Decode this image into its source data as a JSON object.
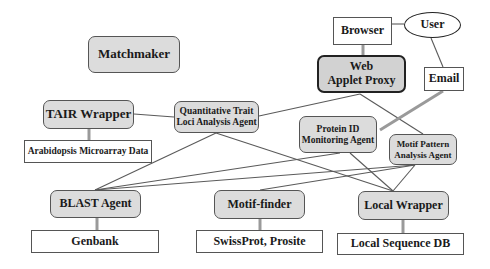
{
  "diagram": {
    "nodes": {
      "matchmaker": {
        "label": "Matchmaker",
        "type": "agent"
      },
      "tair_wrapper": {
        "label": "TAIR Wrapper",
        "type": "agent"
      },
      "arabidopsis": {
        "label": "Arabidopsis Microarray Data",
        "type": "data-store"
      },
      "qtl_agent": {
        "line1": "Quantitative Trait",
        "line2": "Loci Analysis Agent",
        "type": "agent"
      },
      "browser": {
        "label": "Browser",
        "type": "box"
      },
      "user": {
        "label": "User",
        "type": "ellipse"
      },
      "web_applet_proxy": {
        "line1": "Web",
        "line2": "Applet Proxy",
        "type": "agent"
      },
      "email": {
        "label": "Email",
        "type": "box"
      },
      "protein_id": {
        "line1": "Protein ID",
        "line2": "Monitoring Agent",
        "type": "agent"
      },
      "motif_pattern": {
        "line1": "Motif Pattern",
        "line2": "Analysis Agent",
        "type": "agent"
      },
      "blast_agent": {
        "label": "BLAST Agent",
        "type": "agent"
      },
      "motif_finder": {
        "label": "Motif-finder",
        "type": "agent"
      },
      "local_wrapper": {
        "label": "Local Wrapper",
        "type": "agent"
      },
      "genbank": {
        "label": "Genbank",
        "type": "data-store"
      },
      "swissprot": {
        "label": "SwissProt, Prosite",
        "type": "data-store"
      },
      "local_seq_db": {
        "label": "Local Sequence DB",
        "type": "data-store"
      }
    },
    "edges": [
      {
        "from": "tair_wrapper",
        "to": "arabidopsis",
        "style": "thick"
      },
      {
        "from": "tair_wrapper",
        "to": "qtl_agent",
        "style": "thin"
      },
      {
        "from": "browser",
        "to": "user",
        "style": "thin"
      },
      {
        "from": "browser",
        "to": "web_applet_proxy",
        "style": "thick"
      },
      {
        "from": "user",
        "to": "email",
        "style": "thin"
      },
      {
        "from": "email",
        "to": "protein_id",
        "style": "thick"
      },
      {
        "from": "web_applet_proxy",
        "to": "qtl_agent",
        "style": "thin"
      },
      {
        "from": "web_applet_proxy",
        "to": "motif_pattern",
        "style": "thin"
      },
      {
        "from": "qtl_agent",
        "to": "blast_agent",
        "style": "thin"
      },
      {
        "from": "qtl_agent",
        "to": "local_wrapper",
        "style": "thin"
      },
      {
        "from": "protein_id",
        "to": "blast_agent",
        "style": "thin"
      },
      {
        "from": "protein_id",
        "to": "local_wrapper",
        "style": "thin"
      },
      {
        "from": "motif_pattern",
        "to": "blast_agent",
        "style": "thin"
      },
      {
        "from": "motif_pattern",
        "to": "motif_finder",
        "style": "thin"
      },
      {
        "from": "motif_pattern",
        "to": "local_wrapper",
        "style": "thin"
      },
      {
        "from": "blast_agent",
        "to": "genbank",
        "style": "thick"
      },
      {
        "from": "motif_finder",
        "to": "swissprot",
        "style": "thick"
      },
      {
        "from": "local_wrapper",
        "to": "local_seq_db",
        "style": "thick"
      }
    ],
    "colors": {
      "agent_fill": "#dcdcdc",
      "line": "#555555",
      "thick_line": "#9a9a9a"
    }
  }
}
